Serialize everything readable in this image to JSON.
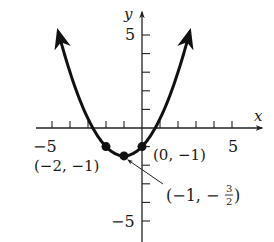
{
  "chart_data": {
    "type": "line",
    "title": "",
    "xlabel": "x",
    "ylabel": "y",
    "xlim": [
      -5.5,
      6.5
    ],
    "ylim": [
      -6,
      6
    ],
    "grid": false,
    "x_tick_labels": [
      {
        "value": -5,
        "label": "−5"
      },
      {
        "value": 5,
        "label": "5"
      }
    ],
    "y_tick_labels": [
      {
        "value": 5,
        "label": "5"
      },
      {
        "value": -5,
        "label": "−5"
      }
    ],
    "x_ticks": [
      -5,
      -4,
      -3,
      -2,
      -1,
      1,
      2,
      3,
      4,
      5
    ],
    "y_ticks": [
      -5,
      -4,
      -3,
      -2,
      -1,
      1,
      2,
      3,
      4,
      5
    ],
    "series": [
      {
        "name": "parabola",
        "equation": "y = 1/2 x^2 + x - 1",
        "arrows_both_ends": true,
        "x": [
          -4.65,
          -4,
          -3,
          -2,
          -1,
          0,
          1,
          2,
          2.65
        ],
        "y": [
          5.16,
          3,
          0.5,
          -1,
          -1.5,
          -1,
          0.5,
          3,
          5.16
        ]
      }
    ],
    "highlighted_points": [
      {
        "x": -2,
        "y": -1,
        "label": "(−2, −1)"
      },
      {
        "x": -1,
        "y": -1.5,
        "label": "(−1, −",
        "frac_num": "3",
        "frac_den": "2",
        "label_end": ")"
      },
      {
        "x": 0,
        "y": -1,
        "label": "(0, −1)"
      }
    ],
    "colors": {
      "curve": "#111111",
      "axis": "#222222",
      "text": "#1a1a1a"
    }
  },
  "labels": {
    "x_axis": "x",
    "y_axis": "y",
    "x_neg5": "−5",
    "x_pos5": "5",
    "y_pos5": "5",
    "y_neg5": "−5",
    "pt_left": "(−2, −1)",
    "pt_right": "(0, −1)",
    "pt_vertex_open": "(−1, −",
    "pt_vertex_num": "3",
    "pt_vertex_den": "2",
    "pt_vertex_close": ")"
  }
}
